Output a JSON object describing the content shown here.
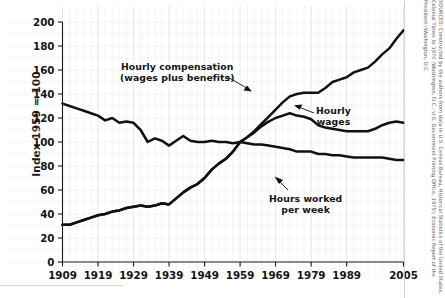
{
  "chart_data": {
    "type": "line",
    "title": "",
    "subtitle": "",
    "xlabel": "",
    "ylabel": "Index 1959 = 100",
    "xlim": [
      1909,
      2005
    ],
    "ylim": [
      0,
      200
    ],
    "grid": true,
    "legend_position": "inline-annotations",
    "y_ticks": [
      0,
      20,
      40,
      60,
      80,
      100,
      120,
      140,
      160,
      180,
      200
    ],
    "x_ticks": [
      1909,
      1919,
      1929,
      1939,
      1949,
      1959,
      1969,
      1979,
      1989,
      2005
    ],
    "annotations": [
      {
        "name": "hourly-compensation-label",
        "line1": "Hourly compensation",
        "line2": "(wages plus benefits)"
      },
      {
        "name": "hourly-wages-label",
        "line1": "Hourly",
        "line2": "wages"
      },
      {
        "name": "hours-worked-label",
        "line1": "Hours worked",
        "line2": "per week"
      }
    ],
    "series": [
      {
        "name": "Hourly compensation (wages plus benefits)",
        "color": "#111111",
        "x": [
          1909,
          1911,
          1913,
          1915,
          1917,
          1919,
          1921,
          1923,
          1925,
          1927,
          1929,
          1931,
          1933,
          1935,
          1937,
          1939,
          1941,
          1943,
          1945,
          1947,
          1949,
          1951,
          1953,
          1955,
          1957,
          1959,
          1961,
          1963,
          1965,
          1967,
          1969,
          1971,
          1973,
          1975,
          1977,
          1979,
          1981,
          1983,
          1985,
          1987,
          1989,
          1991,
          1993,
          1995,
          1997,
          1999,
          2001,
          2003,
          2005
        ],
        "values": [
          31,
          31,
          33,
          35,
          37,
          39,
          40,
          42,
          43,
          45,
          46,
          47,
          46,
          47,
          49,
          48,
          53,
          58,
          62,
          65,
          70,
          77,
          82,
          86,
          92,
          100,
          104,
          109,
          115,
          121,
          127,
          133,
          138,
          140,
          141,
          141,
          141,
          145,
          150,
          152,
          154,
          158,
          160,
          162,
          167,
          173,
          178,
          186,
          193
        ]
      },
      {
        "name": "Hourly wages",
        "color": "#111111",
        "x": [
          1909,
          1911,
          1913,
          1915,
          1917,
          1919,
          1921,
          1923,
          1925,
          1927,
          1929,
          1931,
          1933,
          1935,
          1937,
          1939,
          1941,
          1943,
          1945,
          1947,
          1949,
          1951,
          1953,
          1955,
          1957,
          1959,
          1961,
          1963,
          1965,
          1967,
          1969,
          1971,
          1973,
          1975,
          1977,
          1979,
          1981,
          1983,
          1985,
          1987,
          1989,
          1991,
          1993,
          1995,
          1997,
          1999,
          2001,
          2003,
          2005
        ],
        "values": [
          31,
          31,
          33,
          35,
          37,
          39,
          40,
          42,
          43,
          45,
          46,
          47,
          46,
          47,
          49,
          48,
          53,
          58,
          62,
          65,
          70,
          77,
          82,
          86,
          92,
          100,
          104,
          108,
          113,
          117,
          120,
          122,
          124,
          122,
          121,
          119,
          114,
          112,
          111,
          110,
          109,
          109,
          109,
          109,
          111,
          114,
          116,
          117,
          116
        ]
      },
      {
        "name": "Hours worked per week",
        "color": "#111111",
        "x": [
          1909,
          1911,
          1913,
          1915,
          1917,
          1919,
          1921,
          1923,
          1925,
          1927,
          1929,
          1931,
          1933,
          1935,
          1937,
          1939,
          1941,
          1943,
          1945,
          1947,
          1949,
          1951,
          1953,
          1955,
          1957,
          1959,
          1961,
          1963,
          1965,
          1967,
          1969,
          1971,
          1973,
          1975,
          1977,
          1979,
          1981,
          1983,
          1985,
          1987,
          1989,
          1991,
          1993,
          1995,
          1997,
          1999,
          2001,
          2003,
          2005
        ],
        "values": [
          132,
          130,
          128,
          126,
          124,
          122,
          118,
          120,
          116,
          117,
          116,
          110,
          100,
          103,
          101,
          97,
          101,
          105,
          101,
          100,
          100,
          101,
          100,
          100,
          99,
          100,
          99,
          98,
          98,
          97,
          96,
          95,
          94,
          92,
          92,
          92,
          90,
          90,
          89,
          89,
          88,
          87,
          87,
          87,
          87,
          87,
          86,
          85,
          85
        ]
      }
    ]
  },
  "source_note": "SOURCES: Constructed by the authors from data in U.S. Census Bureau, Historical Statistics of the United States, Colonial Times to 1970 (Washington, D.C.: U.S. Government Printing Office, 1975); Economic Report of the President (Washington, D.C."
}
